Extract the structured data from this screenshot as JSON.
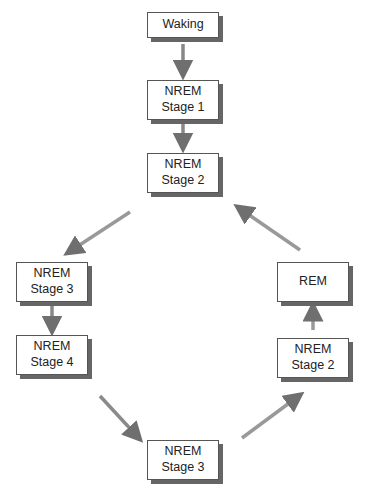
{
  "diagram": {
    "nodes": [
      {
        "id": "waking",
        "lines": [
          "Waking"
        ],
        "x": 147,
        "y": 12,
        "w": 72,
        "h": 26
      },
      {
        "id": "nrem1",
        "lines": [
          "NREM",
          "Stage 1"
        ],
        "x": 147,
        "y": 80,
        "w": 72,
        "h": 40
      },
      {
        "id": "nrem2-top",
        "lines": [
          "NREM",
          "Stage 2"
        ],
        "x": 147,
        "y": 153,
        "w": 72,
        "h": 40
      },
      {
        "id": "nrem3-left",
        "lines": [
          "NREM",
          "Stage 3"
        ],
        "x": 16,
        "y": 262,
        "w": 72,
        "h": 40
      },
      {
        "id": "nrem4",
        "lines": [
          "NREM",
          "Stage 4"
        ],
        "x": 16,
        "y": 335,
        "w": 72,
        "h": 40
      },
      {
        "id": "nrem3-bottom",
        "lines": [
          "NREM",
          "Stage 3"
        ],
        "x": 147,
        "y": 440,
        "w": 72,
        "h": 40
      },
      {
        "id": "nrem2-right",
        "lines": [
          "NREM",
          "Stage 2"
        ],
        "x": 277,
        "y": 338,
        "w": 72,
        "h": 40
      },
      {
        "id": "rem",
        "lines": [
          "REM"
        ],
        "x": 277,
        "y": 262,
        "w": 72,
        "h": 40
      }
    ],
    "edges": [
      {
        "from": "waking",
        "to": "nrem1"
      },
      {
        "from": "nrem1",
        "to": "nrem2-top"
      },
      {
        "from": "nrem2-top",
        "to": "nrem3-left"
      },
      {
        "from": "nrem3-left",
        "to": "nrem4"
      },
      {
        "from": "nrem4",
        "to": "nrem3-bottom"
      },
      {
        "from": "nrem3-bottom",
        "to": "nrem2-right"
      },
      {
        "from": "nrem2-right",
        "to": "rem"
      },
      {
        "from": "rem",
        "to": "nrem2-top"
      }
    ],
    "colors": {
      "arrow": "#777777",
      "box_border": "#555555",
      "shadow": "#666666"
    }
  }
}
